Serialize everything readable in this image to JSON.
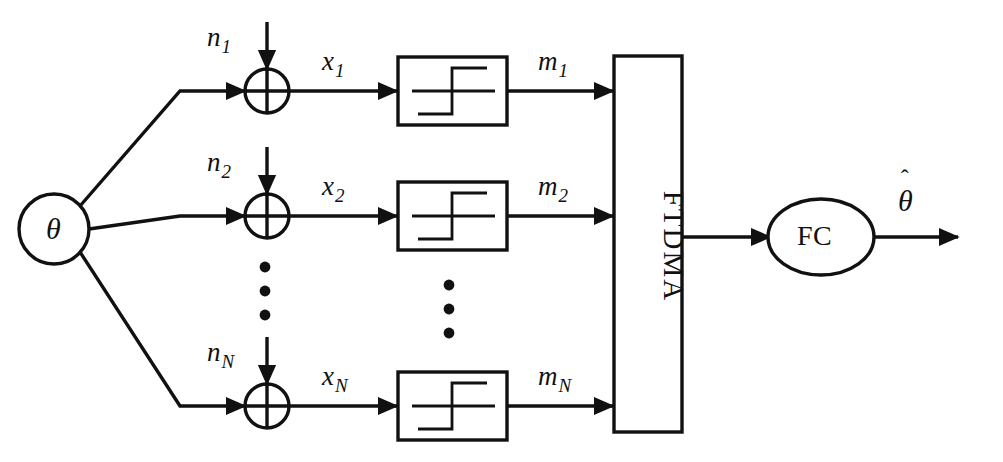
{
  "figure": {
    "type": "block-diagram",
    "background_color": "#ffffff",
    "line_color": "#111111"
  },
  "source_node": {
    "label": "θ",
    "shape": "circle",
    "name": "parameter-theta"
  },
  "branches": [
    {
      "index": 1,
      "noise_label_base": "n",
      "noise_label_sub": "1",
      "signal_label_base": "x",
      "signal_label_sub": "1",
      "message_label_base": "m",
      "message_label_sub": "1",
      "adder_symbol": "⊕",
      "quantizer_symbol": "staircase"
    },
    {
      "index": 2,
      "noise_label_base": "n",
      "noise_label_sub": "2",
      "signal_label_base": "x",
      "signal_label_sub": "2",
      "message_label_base": "m",
      "message_label_sub": "2",
      "adder_symbol": "⊕",
      "quantizer_symbol": "staircase"
    },
    {
      "index": 3,
      "noise_label_base": "n",
      "noise_label_sub": "N",
      "signal_label_base": "x",
      "signal_label_sub": "N",
      "message_label_base": "m",
      "message_label_sub": "N",
      "adder_symbol": "⊕",
      "quantizer_symbol": "staircase"
    }
  ],
  "ellipsis": {
    "symbol": "•",
    "count": 3
  },
  "multiple_access_block": {
    "label": "FTDMA",
    "orientation": "vertical",
    "shape": "rectangle"
  },
  "fusion_center": {
    "label": "FC",
    "shape": "ellipse"
  },
  "output": {
    "base": "θ",
    "accent": "ˆ",
    "description": "theta-hat estimate"
  }
}
